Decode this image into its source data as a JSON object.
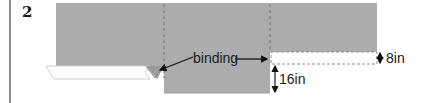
{
  "figure": {
    "step_number": "2",
    "labels": {
      "binding": "binding",
      "width_top": "8in",
      "height_drop": "16in"
    },
    "colors": {
      "fabric": "#acacac",
      "fold_edge": "#d8d8d8",
      "dash": "#7a7a7a",
      "arrow": "#111111",
      "frame": "#8a8a8a"
    }
  }
}
